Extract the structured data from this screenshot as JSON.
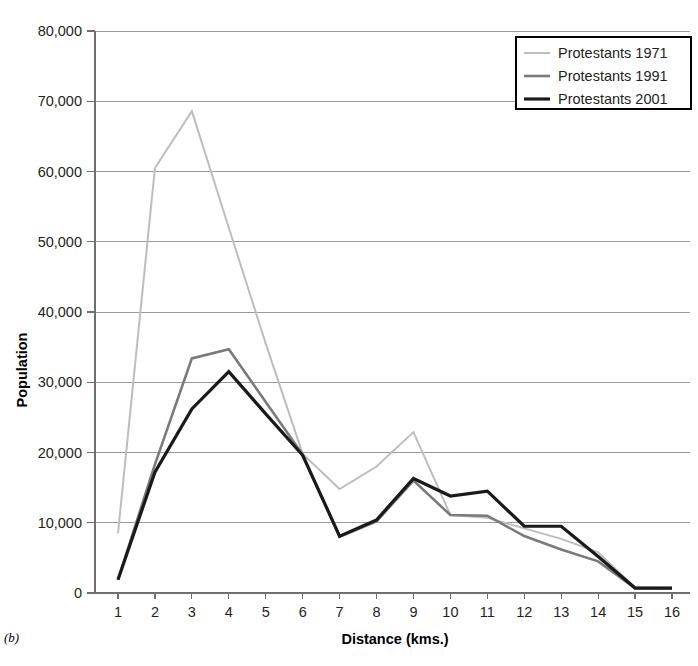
{
  "figure": {
    "panel_label": "(b)",
    "width": 698,
    "height": 666
  },
  "chart_data": {
    "type": "line",
    "title": "",
    "xlabel": "Distance (kms.)",
    "ylabel": "Population",
    "x": [
      1,
      2,
      3,
      4,
      5,
      6,
      7,
      8,
      9,
      10,
      11,
      12,
      13,
      14,
      15,
      16
    ],
    "categories": [
      "1",
      "2",
      "3",
      "4",
      "5",
      "6",
      "7",
      "8",
      "9",
      "10",
      "11",
      "12",
      "13",
      "14",
      "15",
      "16"
    ],
    "xtick_labels": [
      "1",
      "2",
      "3",
      "4",
      "5",
      "6",
      "7",
      "8",
      "9",
      "10",
      "11",
      "12",
      "13",
      "14",
      "15",
      "16"
    ],
    "ytick_labels": [
      "0",
      "10,000",
      "20,000",
      "30,000",
      "40,000",
      "50,000",
      "60,000",
      "70,000",
      "80,000"
    ],
    "yticks": [
      0,
      10000,
      20000,
      30000,
      40000,
      50000,
      60000,
      70000,
      80000
    ],
    "ylim": [
      0,
      80000
    ],
    "xlim": [
      1,
      16
    ],
    "grid": "horizontal",
    "legend_position": "top-right",
    "series": [
      {
        "name": "Protestants 1971",
        "color": "#bdbdbd",
        "width": 2.0,
        "values": [
          8500,
          60500,
          68600,
          52000,
          35500,
          19800,
          14800,
          18000,
          22900,
          11100,
          10700,
          9200,
          7700,
          5800,
          800,
          700
        ]
      },
      {
        "name": "Protestants 1991",
        "color": "#7a7a7a",
        "width": 2.6,
        "values": [
          1900,
          18300,
          33400,
          34700,
          27200,
          19700,
          8000,
          10200,
          16000,
          11100,
          11000,
          8100,
          6200,
          4500,
          700,
          700
        ]
      },
      {
        "name": "Protestants 2001",
        "color": "#1a1a1a",
        "width": 3.2,
        "values": [
          1900,
          17200,
          26200,
          31500,
          25500,
          19600,
          8100,
          10400,
          16300,
          13800,
          14500,
          9500,
          9500,
          5200,
          700,
          700
        ]
      }
    ]
  },
  "legend": {
    "entries": [
      {
        "label": "Protestants 1971"
      },
      {
        "label": "Protestants 1991"
      },
      {
        "label": "Protestants 2001"
      }
    ]
  },
  "axes": {
    "x_title": "Distance (kms.)",
    "y_title": "Population"
  },
  "colors": {
    "grid": "#9a9a9a",
    "axis": "#6f6f6f",
    "text": "#231f20",
    "series_1971": "#bdbdbd",
    "series_1991": "#7a7a7a",
    "series_2001": "#1a1a1a"
  }
}
